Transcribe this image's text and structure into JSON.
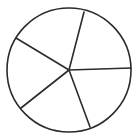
{
  "diagram": {
    "type": "circle-divided-into-sectors",
    "sector_count": 5,
    "stroke_color": "#2b2b2b",
    "background_color": "#ffffff",
    "stroke_width": 1.6,
    "circle": {
      "cx": 69,
      "cy": 70,
      "r": 62
    },
    "center": {
      "x": 69,
      "y": 70
    },
    "spokes": [
      {
        "name": "spoke-top",
        "x2": 84,
        "y2": 12
      },
      {
        "name": "spoke-right",
        "x2": 131,
        "y2": 68
      },
      {
        "name": "spoke-bottom-right",
        "x2": 90,
        "y2": 127
      },
      {
        "name": "spoke-bottom-left",
        "x2": 21,
        "y2": 108
      },
      {
        "name": "spoke-upper-left",
        "x2": 16,
        "y2": 38
      }
    ]
  }
}
